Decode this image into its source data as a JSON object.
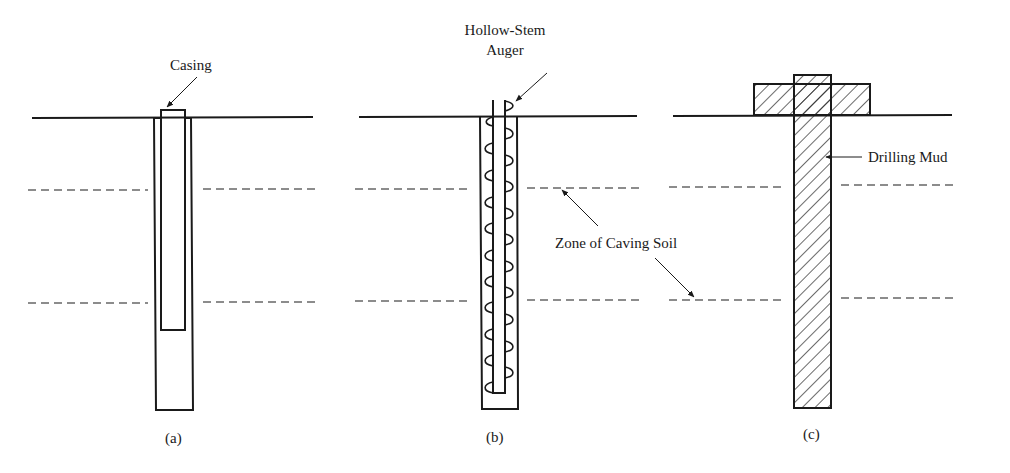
{
  "figure": {
    "panels": [
      {
        "id": "a",
        "caption": "(a)",
        "label": "Casing"
      },
      {
        "id": "b",
        "caption": "(b)",
        "label_line1": "Hollow-Stem",
        "label_line2": "Auger"
      },
      {
        "id": "c",
        "caption": "(c)",
        "label": "Drilling Mud"
      }
    ],
    "shared_label": "Zone of Caving Soil"
  }
}
